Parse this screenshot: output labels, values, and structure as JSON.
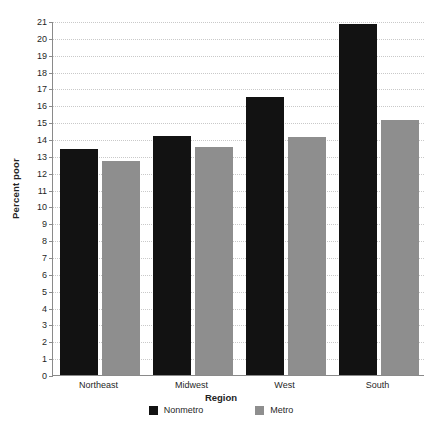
{
  "chart_data": {
    "type": "bar",
    "title": "",
    "xlabel": "Region",
    "ylabel": "Percent poor",
    "categories": [
      "Northeast",
      "Midwest",
      "West",
      "South"
    ],
    "series": [
      {
        "name": "Nonmetro",
        "color": "#121212",
        "values": [
          13.4,
          14.2,
          16.5,
          20.8
        ]
      },
      {
        "name": "Metro",
        "color": "#8e8e8e",
        "values": [
          12.7,
          13.5,
          14.1,
          15.1
        ]
      }
    ],
    "ylim": [
      0,
      21
    ],
    "ytick_step": 1,
    "yticks": [
      0,
      1,
      2,
      3,
      4,
      5,
      6,
      7,
      8,
      9,
      10,
      11,
      12,
      13,
      14,
      15,
      16,
      17,
      18,
      19,
      20,
      21
    ],
    "grid": true,
    "grid_style": "dotted",
    "legend_position": "bottom",
    "orientation": "vertical",
    "grouping": "grouped"
  },
  "axes": {
    "y_title": "Percent poor",
    "x_title": "Region"
  },
  "legend": {
    "items": [
      {
        "label": "Nonmetro",
        "color": "#121212"
      },
      {
        "label": "Metro",
        "color": "#8e8e8e"
      }
    ]
  },
  "caption": {
    "text": ""
  }
}
